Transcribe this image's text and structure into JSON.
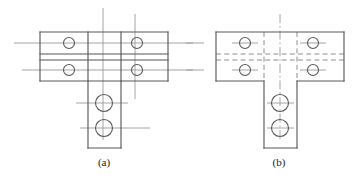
{
  "figure": {
    "background_color": "#ffffff",
    "object_line_color": "#595959",
    "center_line_color": "#8c8c8c",
    "hidden_line_color": "#8c8c8c",
    "caption_color": "#222222"
  },
  "panels": [
    {
      "id": "panel-a",
      "caption": "(a)",
      "caption_x": 104,
      "caption_y": 166,
      "description": "T-bracket front view with solid visible interior edges and plain straight center lines",
      "line_style_interior": "solid",
      "center_line_style": "plain",
      "outline": {
        "plate_left": 40,
        "plate_right": 168,
        "plate_top": 32,
        "plate_bottom": 81,
        "stem_left": 88,
        "stem_right": 121,
        "stem_bottom": 148
      },
      "horizontal_edges": [
        32,
        54,
        60,
        81
      ],
      "vertical_edges": [
        40,
        88,
        121,
        168
      ],
      "holes": [
        {
          "name": "hole-top-left",
          "cx": 69,
          "cy": 43,
          "r": 5.5
        },
        {
          "name": "hole-bot-left",
          "cx": 69,
          "cy": 70,
          "r": 5.5
        },
        {
          "name": "hole-top-right",
          "cx": 137,
          "cy": 43,
          "r": 5.5
        },
        {
          "name": "hole-bot-right",
          "cx": 137,
          "cy": 70,
          "r": 5.5
        },
        {
          "name": "hole-stem-upper",
          "cx": 104,
          "cy": 103,
          "r": 8.5
        },
        {
          "name": "hole-stem-lower",
          "cx": 104,
          "cy": 128,
          "r": 8.5
        }
      ],
      "center_lines_horizontal": [
        {
          "y": 43,
          "x1": 14,
          "x2": 152
        },
        {
          "y": 43,
          "x1": 152,
          "x2": 193
        },
        {
          "y": 70,
          "x1": 22,
          "x2": 120
        },
        {
          "y": 70,
          "x1": 120,
          "x2": 193
        },
        {
          "y": 103,
          "x1": 76,
          "x2": 128
        },
        {
          "y": 128,
          "x1": 80,
          "x2": 150
        }
      ],
      "center_lines_vertical": [
        {
          "x": 103,
          "y1": 8,
          "y2": 140
        },
        {
          "x": 135,
          "y1": 14,
          "y2": 99
        }
      ]
    },
    {
      "id": "panel-b",
      "caption": "(b)",
      "caption_x": 279,
      "caption_y": 166,
      "description": "T-bracket front view with hidden dashed interior edges and dash-dot center lines",
      "line_style_interior": "dashed",
      "center_line_style": "dash-dot",
      "outline": {
        "plate_left": 216,
        "plate_right": 344,
        "plate_top": 32,
        "plate_bottom": 81,
        "stem_left": 264,
        "stem_right": 297,
        "stem_bottom": 148
      },
      "horizontal_edges": [
        32,
        81
      ],
      "hidden_horizontal_edges": [
        54,
        60
      ],
      "vertical_edges": [
        216,
        344
      ],
      "hidden_vertical_edges": [
        264,
        297
      ],
      "holes": [
        {
          "name": "hole-top-left",
          "cx": 245,
          "cy": 43,
          "r": 5.5
        },
        {
          "name": "hole-bot-left",
          "cx": 245,
          "cy": 70,
          "r": 5.5
        },
        {
          "name": "hole-top-right",
          "cx": 313,
          "cy": 43,
          "r": 5.5
        },
        {
          "name": "hole-bot-right",
          "cx": 313,
          "cy": 70,
          "r": 5.5
        },
        {
          "name": "hole-stem-upper",
          "cx": 280,
          "cy": 103,
          "r": 8.5
        },
        {
          "name": "hole-stem-lower",
          "cx": 280,
          "cy": 128,
          "r": 8.5
        }
      ],
      "center_lines_horizontal": [
        {
          "y": 43,
          "x1": 186,
          "x2": 204
        },
        {
          "y": 43,
          "x1": 232,
          "x2": 258
        },
        {
          "y": 43,
          "x1": 300,
          "x2": 326
        },
        {
          "y": 70,
          "x1": 186,
          "x2": 204
        },
        {
          "y": 70,
          "x1": 232,
          "x2": 258
        },
        {
          "y": 70,
          "x1": 300,
          "x2": 326
        },
        {
          "y": 103,
          "x1": 267,
          "x2": 294
        },
        {
          "y": 128,
          "x1": 267,
          "x2": 294
        }
      ],
      "center_lines_vertical": [
        {
          "x": 280,
          "y1": 14,
          "y2": 142
        }
      ]
    }
  ]
}
